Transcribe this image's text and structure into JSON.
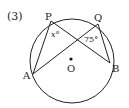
{
  "problem_number": "(3)",
  "points": {
    "P": {
      "label": "P"
    },
    "Q": {
      "label": "Q"
    },
    "A": {
      "label": "A"
    },
    "B": {
      "label": "B"
    },
    "O": {
      "label": "O"
    }
  },
  "angles": {
    "at_P": "x°",
    "at_Q": "75°"
  },
  "colors": {
    "stroke": "#222222",
    "background": "#ffffff"
  }
}
